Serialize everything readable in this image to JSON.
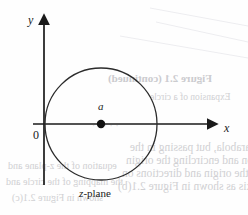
{
  "figure": {
    "caption": "z-plane",
    "caption_italic_part": "z",
    "caption_rest": "-plane",
    "axes": {
      "y_label": "y",
      "x_label": "x",
      "origin_label": "0"
    },
    "center_point_label": "a",
    "colors": {
      "ink": "#1a1a1a",
      "stroke": "#2b2b2b",
      "paper": "#fefefe",
      "bleed_text": "#c9c9cc"
    },
    "geometry": {
      "x_axis_y": 124,
      "y_axis_x": 44,
      "x_axis_start": 33,
      "x_axis_end": 216,
      "y_axis_top": 16,
      "y_axis_bottom": 185,
      "circle_center_x": 101,
      "circle_center_y": 124,
      "circle_radius": 56,
      "center_dot_radius": 4
    }
  },
  "bleed_through": {
    "figure_caption": "Figure 2.1 (continued)",
    "subtitle": "Expansion of a circle",
    "line1": "itself is again a parabola, but passing in the",
    "line2": "opposite direction and encircling the origin",
    "line3": "x = 0. Hence the origin and directions on",
    "line4": "the positive halves of x-axis as shown in Figure 2.1(b)",
    "line5": "equation of the z-plane and",
    "line6": "the mapping of the circle and",
    "line7": "shown in Figure 2.1(c)",
    "dots": "· · · · ·"
  }
}
